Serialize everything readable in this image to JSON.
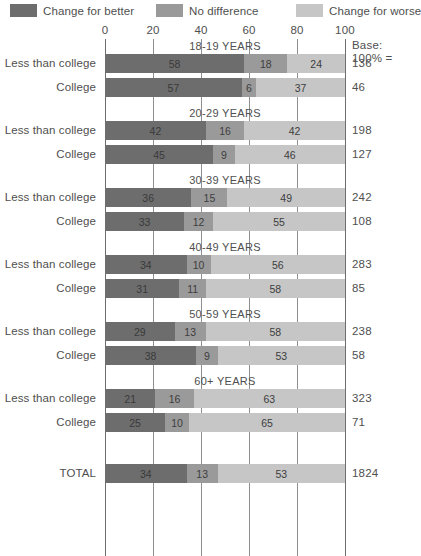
{
  "legend": {
    "items": [
      {
        "label": "Change for better",
        "color": "#6d6d6d",
        "key": "better"
      },
      {
        "label": "No difference",
        "color": "#9a9a9a",
        "key": "same"
      },
      {
        "label": "Change for worse",
        "color": "#c6c6c6",
        "key": "worse"
      }
    ]
  },
  "axis": {
    "ticks": [
      "0",
      "20",
      "40",
      "60",
      "80",
      "100"
    ],
    "min": 0,
    "max": 100
  },
  "base_header": {
    "line1": "Base:",
    "line2": "100% ="
  },
  "chart_data": {
    "type": "bar",
    "orientation": "horizontal",
    "stacked": true,
    "title": "",
    "xlabel": "",
    "ylabel": "",
    "xlim": [
      0,
      100
    ],
    "grid": true,
    "legend_position": "top",
    "series": [
      {
        "name": "Change for better",
        "color": "#6d6d6d"
      },
      {
        "name": "No difference",
        "color": "#9a9a9a"
      },
      {
        "name": "Change for worse",
        "color": "#c6c6c6"
      }
    ],
    "groups": [
      {
        "band": "18-19 YEARS",
        "rows": [
          {
            "label": "Less than college",
            "values": [
              58,
              18,
              24
            ],
            "base": "136"
          },
          {
            "label": "College",
            "values": [
              57,
              6,
              37
            ],
            "base": "46"
          }
        ]
      },
      {
        "band": "20-29 YEARS",
        "rows": [
          {
            "label": "Less than college",
            "values": [
              42,
              16,
              42
            ],
            "base": "198"
          },
          {
            "label": "College",
            "values": [
              45,
              9,
              46
            ],
            "base": "127"
          }
        ]
      },
      {
        "band": "30-39 YEARS",
        "rows": [
          {
            "label": "Less than college",
            "values": [
              36,
              15,
              49
            ],
            "base": "242"
          },
          {
            "label": "College",
            "values": [
              33,
              12,
              55
            ],
            "base": "108"
          }
        ]
      },
      {
        "band": "40-49 YEARS",
        "rows": [
          {
            "label": "Less than college",
            "values": [
              34,
              10,
              56
            ],
            "base": "283"
          },
          {
            "label": "College",
            "values": [
              31,
              11,
              58
            ],
            "base": "85"
          }
        ]
      },
      {
        "band": "50-59 YEARS",
        "rows": [
          {
            "label": "Less than college",
            "values": [
              29,
              13,
              58
            ],
            "base": "238"
          },
          {
            "label": "College",
            "values": [
              38,
              9,
              53
            ],
            "base": "58"
          }
        ]
      },
      {
        "band": "60+ YEARS",
        "rows": [
          {
            "label": "Less than college",
            "values": [
              21,
              16,
              63
            ],
            "base": "323"
          },
          {
            "label": "College",
            "values": [
              25,
              10,
              65
            ],
            "base": "71"
          }
        ]
      },
      {
        "band": "",
        "rows": [
          {
            "label": "TOTAL",
            "values": [
              34,
              13,
              53
            ],
            "base": "1824"
          }
        ]
      }
    ]
  }
}
